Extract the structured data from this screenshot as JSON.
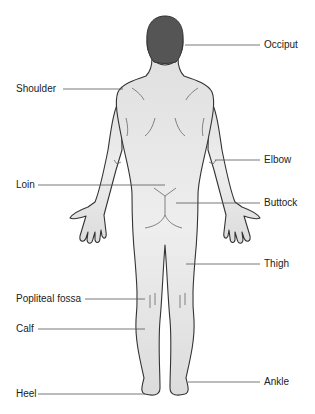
{
  "diagram": {
    "labels": [
      {
        "id": "occiput",
        "text": "Occiput",
        "side": "right",
        "x": 264,
        "y": 40
      },
      {
        "id": "shoulder",
        "text": "Shoulder",
        "side": "left",
        "x": 16,
        "y": 84
      },
      {
        "id": "elbow",
        "text": "Elbow",
        "side": "right",
        "x": 264,
        "y": 155
      },
      {
        "id": "loin",
        "text": "Loin",
        "side": "left",
        "x": 16,
        "y": 180
      },
      {
        "id": "buttock",
        "text": "Buttock",
        "side": "right",
        "x": 264,
        "y": 198
      },
      {
        "id": "thigh",
        "text": "Thigh",
        "side": "right",
        "x": 264,
        "y": 259
      },
      {
        "id": "popliteal-fossa",
        "text": "Popliteal fossa",
        "side": "left",
        "x": 16,
        "y": 293
      },
      {
        "id": "calf",
        "text": "Calf",
        "side": "left",
        "x": 16,
        "y": 323
      },
      {
        "id": "ankle",
        "text": "Ankle",
        "side": "right",
        "x": 264,
        "y": 377
      },
      {
        "id": "heel",
        "text": "Heel",
        "side": "left",
        "x": 16,
        "y": 388
      }
    ],
    "colors": {
      "hair": "#555555",
      "skin": "#e6e6e6",
      "outline": "#333333",
      "leader": "#555555",
      "text": "#222222"
    }
  }
}
